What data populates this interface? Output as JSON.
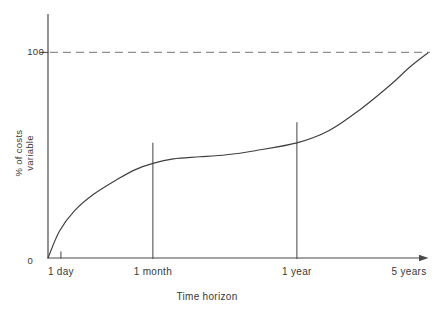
{
  "colors": {
    "background": "#ffffff",
    "axis": "#4a4a4a",
    "curve": "#3f3f3f",
    "dashed_reference": "#8f8f8f",
    "text": "#383838"
  },
  "chart_data": {
    "type": "line",
    "title": "",
    "xlabel": "Time horizon",
    "ylabel": "% of costs variable",
    "ylabel_lines": [
      "% of costs",
      "variable"
    ],
    "ylim": [
      0,
      100
    ],
    "grid": false,
    "legend": "none",
    "y_axis": {
      "tick_label": "100",
      "tick_value": 100,
      "origin_label": "0"
    },
    "x_axis": {
      "label": "Time horizon",
      "ticks": [
        {
          "label": "1 day",
          "pos": 0.034,
          "marker": "tick"
        },
        {
          "label": "1 month",
          "pos": 0.276,
          "marker": "vline",
          "marker_top_value": 56
        },
        {
          "label": "1 year",
          "pos": 0.655,
          "marker": "vline",
          "marker_top_value": 66
        },
        {
          "label": "5 years",
          "pos": 0.95,
          "marker": "none"
        }
      ]
    },
    "reference_line": {
      "value": 100,
      "style": "dashed"
    },
    "series": [
      {
        "name": "% of costs variable vs time horizon",
        "points": [
          [
            0.0,
            0
          ],
          [
            0.03,
            13
          ],
          [
            0.07,
            23
          ],
          [
            0.12,
            31
          ],
          [
            0.18,
            38
          ],
          [
            0.23,
            43
          ],
          [
            0.276,
            46
          ],
          [
            0.33,
            48.2
          ],
          [
            0.4,
            49.2
          ],
          [
            0.47,
            50.2
          ],
          [
            0.545,
            52.2
          ],
          [
            0.655,
            56
          ],
          [
            0.74,
            62
          ],
          [
            0.82,
            72
          ],
          [
            0.9,
            84
          ],
          [
            0.953,
            93
          ],
          [
            1.0,
            99.8
          ]
        ]
      }
    ]
  }
}
